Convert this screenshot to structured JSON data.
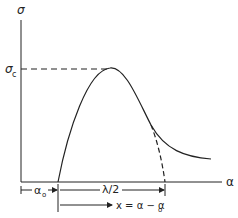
{
  "diagram": {
    "y_axis_label": "σ",
    "x_axis_label": "α",
    "peak_label": "σ",
    "peak_label_sub": "c",
    "a0_label": "α",
    "a0_sub": "o",
    "half_lambda_label": "λ/2",
    "x_def_label": "x = α − α",
    "x_def_sub": "o",
    "colors": {
      "line": "#222222",
      "background": "#ffffff"
    }
  }
}
